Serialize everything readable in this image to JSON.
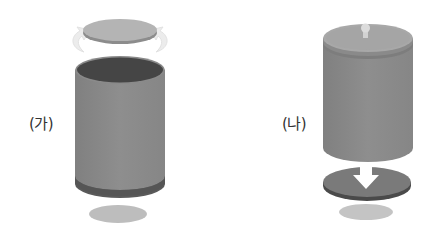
{
  "figure": {
    "panels": [
      {
        "id": "ga",
        "label": "(가)",
        "description": "Open cylinder with lid lifted off the top (curved arrows beside lid) and bottom disk removed below"
      },
      {
        "id": "na",
        "label": "(나)",
        "description": "Cylinder closed with knobbed lid on top, lifted above a disk with a downward arrow, shadow below"
      }
    ],
    "colors": {
      "body": "#8a8a8a",
      "body_dark": "#5a5a5a",
      "interior": "#454545",
      "lid": "#b4b4b4",
      "lid_rim": "#8c8c8c",
      "disk_light": "#bdbdbd",
      "disk_dark": "#7a7a7a",
      "disk_rim": "#4a4a4a",
      "arrow": "#ffffff",
      "curved_arrow": "#ececec"
    }
  }
}
